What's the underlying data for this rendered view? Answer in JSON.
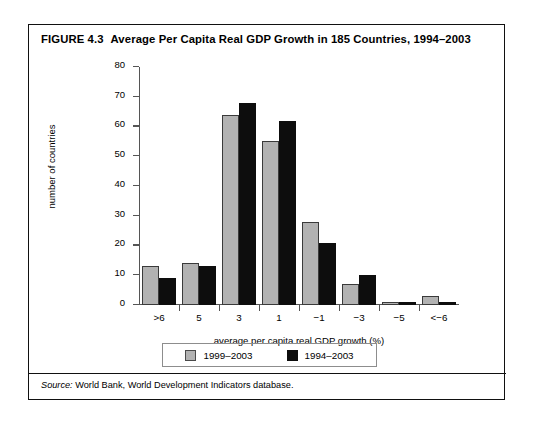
{
  "figure": {
    "number": "FIGURE 4.3",
    "title": "Average Per Capita Real GDP Growth in 185 Countries, 1994–2003",
    "source_prefix": "Source:",
    "source_text": " World Bank, World Development Indicators database."
  },
  "chart_data": {
    "type": "bar",
    "title": "Average Per Capita Real GDP Growth in 185 Countries, 1994–2003",
    "xlabel": "average per capita real GDP growth (%)",
    "ylabel": "number of countries",
    "categories": [
      ">6",
      "5",
      "3",
      "1",
      "−1",
      "−3",
      "−5",
      "<−6"
    ],
    "series": [
      {
        "name": "1999–2003",
        "color": "#b2b2b2",
        "values": [
          13,
          14,
          64,
          55,
          28,
          7,
          1,
          3
        ]
      },
      {
        "name": "1994–2003",
        "color": "#0d0d0d",
        "values": [
          9,
          13,
          68,
          62,
          21,
          10,
          1,
          1
        ]
      }
    ],
    "ylim": [
      0,
      80
    ],
    "yticks": [
      0,
      10,
      20,
      30,
      40,
      50,
      60,
      70,
      80
    ],
    "grid": false,
    "legend_position": "bottom"
  }
}
